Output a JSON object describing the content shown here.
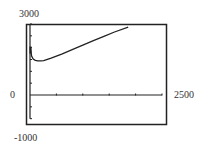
{
  "chart_data": {
    "type": "line",
    "title": "",
    "xlabel": "",
    "ylabel": "",
    "xlim": [
      0,
      2500
    ],
    "ylim": [
      -1000,
      3000
    ],
    "x_tick_step": 500,
    "y_tick_step": 500,
    "grid": false,
    "legend": null,
    "window_labels": {
      "ymax": "3000",
      "ymin": "-1000",
      "xmin": "0",
      "xmax": "2500"
    },
    "series": [
      {
        "name": "curve",
        "x": [
          5,
          15,
          30,
          60,
          100,
          150,
          200,
          260,
          400,
          600,
          800,
          1000,
          1200,
          1400,
          1600,
          1860
        ],
        "y": [
          2000,
          1900,
          1650,
          1520,
          1460,
          1440,
          1440,
          1450,
          1560,
          1730,
          1920,
          2110,
          2300,
          2480,
          2660,
          2870
        ]
      }
    ]
  },
  "colors": {
    "frame": "#222222",
    "axis": "#222222",
    "curve": "#222222",
    "background": "#ffffff"
  }
}
